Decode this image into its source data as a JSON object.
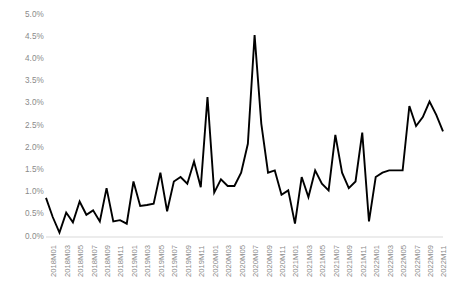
{
  "chart_data": {
    "type": "line",
    "title": "",
    "xlabel": "",
    "ylabel": "",
    "ylim": [
      0.0,
      5.0
    ],
    "y_tick_labels": [
      "0.0%",
      "0.5%",
      "1.0%",
      "1.5%",
      "2.0%",
      "2.5%",
      "3.0%",
      "3.5%",
      "4.0%",
      "4.5%",
      "5.0%"
    ],
    "y_tick_values": [
      0.0,
      0.5,
      1.0,
      1.5,
      2.0,
      2.5,
      3.0,
      3.5,
      4.0,
      4.5,
      5.0
    ],
    "grid": false,
    "legend": null,
    "line_color": "#000000",
    "axis_color": "#d9d9d9",
    "tick_label_color": "#8a8a8a",
    "x_tick_labels": [
      "2018M01",
      "2018M03",
      "2018M05",
      "2018M07",
      "2018M09",
      "2018M11",
      "2019M01",
      "2019M03",
      "2019M05",
      "2019M07",
      "2019M09",
      "2019M11",
      "2020M01",
      "2020M03",
      "2020M05",
      "2020M07",
      "2020M09",
      "2020M11",
      "2021M01",
      "2021M03",
      "2021M05",
      "2021M07",
      "2021M09",
      "2021M11",
      "2022M01",
      "2022M03",
      "2022M05",
      "2022M07",
      "2022M09",
      "2022M11"
    ],
    "x": [
      "2018M01",
      "2018M02",
      "2018M03",
      "2018M04",
      "2018M05",
      "2018M06",
      "2018M07",
      "2018M08",
      "2018M09",
      "2018M10",
      "2018M11",
      "2018M12",
      "2019M01",
      "2019M02",
      "2019M03",
      "2019M04",
      "2019M05",
      "2019M06",
      "2019M07",
      "2019M08",
      "2019M09",
      "2019M10",
      "2019M11",
      "2019M12",
      "2020M01",
      "2020M02",
      "2020M03",
      "2020M04",
      "2020M05",
      "2020M06",
      "2020M07",
      "2020M08",
      "2020M09",
      "2020M10",
      "2020M11",
      "2020M12",
      "2021M01",
      "2021M02",
      "2021M03",
      "2021M04",
      "2021M05",
      "2021M06",
      "2021M07",
      "2021M08",
      "2021M09",
      "2021M10",
      "2021M11",
      "2021M12",
      "2022M01",
      "2022M02",
      "2022M03",
      "2022M04",
      "2022M05",
      "2022M06",
      "2022M07",
      "2022M08",
      "2022M09",
      "2022M10",
      "2022M11",
      "2022M12"
    ],
    "values": [
      0.88,
      0.45,
      0.1,
      0.55,
      0.33,
      0.8,
      0.5,
      0.6,
      0.35,
      1.1,
      0.35,
      0.38,
      0.3,
      1.25,
      0.7,
      0.72,
      0.75,
      1.45,
      0.58,
      1.25,
      1.35,
      1.2,
      1.7,
      1.12,
      3.15,
      1.0,
      1.3,
      1.15,
      1.15,
      1.45,
      2.1,
      4.55,
      2.55,
      1.45,
      1.5,
      0.95,
      1.05,
      0.3,
      1.35,
      0.9,
      1.5,
      1.2,
      1.05,
      2.3,
      1.45,
      1.1,
      1.25,
      2.35,
      0.35,
      1.35,
      1.45,
      1.5,
      1.5,
      1.5,
      2.95,
      2.5,
      2.7,
      3.05,
      2.75,
      2.38
    ]
  }
}
